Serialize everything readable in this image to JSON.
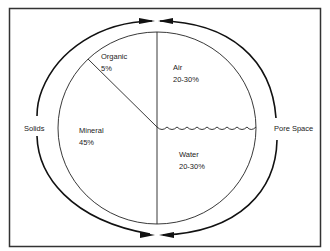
{
  "diagram": {
    "segments": [
      {
        "name": "Organic",
        "value": "5%"
      },
      {
        "name": "Air",
        "value": "20-30%"
      },
      {
        "name": "Mineral",
        "value": "45%"
      },
      {
        "name": "Water",
        "value": "20-30%"
      }
    ],
    "outer_labels": {
      "left": "Solids",
      "right": "Pore Space"
    },
    "colors": {
      "line": "#1a1a1a",
      "border": "#333333",
      "background": "#ffffff"
    }
  }
}
